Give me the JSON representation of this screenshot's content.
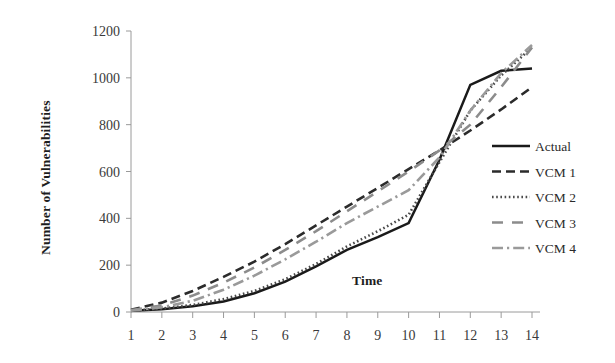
{
  "chart_data": {
    "type": "line",
    "title": "",
    "xlabel": "Time",
    "ylabel": "Number of Vulnerabilities",
    "x": [
      1,
      2,
      3,
      4,
      5,
      6,
      7,
      8,
      9,
      10,
      11,
      12,
      13,
      14
    ],
    "xticklabels": [
      "1",
      "2",
      "3",
      "4",
      "5",
      "6",
      "7",
      "8",
      "9",
      "10",
      "11",
      "12",
      "13",
      "14"
    ],
    "yticklabels": [
      "0",
      "200",
      "400",
      "600",
      "800",
      "1000",
      "1200"
    ],
    "yticks": [
      0,
      200,
      400,
      600,
      800,
      1000,
      1200
    ],
    "ylim": [
      0,
      1200
    ],
    "xlim": [
      1,
      14
    ],
    "grid": false,
    "legend_position": "right",
    "series": [
      {
        "name": "Actual",
        "style": "solid",
        "color": "#1a1a1a",
        "values": [
          5,
          12,
          25,
          45,
          80,
          130,
          195,
          265,
          320,
          380,
          650,
          970,
          1030,
          1040
        ]
      },
      {
        "name": "VCM 1",
        "style": "dashed",
        "color": "#2b2b2b",
        "values": [
          10,
          40,
          90,
          150,
          215,
          290,
          370,
          450,
          530,
          610,
          690,
          775,
          865,
          960
        ]
      },
      {
        "name": "VCM 2",
        "style": "dotted",
        "color": "#4a4a4a",
        "values": [
          5,
          15,
          30,
          55,
          90,
          140,
          205,
          280,
          345,
          415,
          640,
          860,
          1010,
          1130
        ]
      },
      {
        "name": "VCM 3",
        "style": "longdash",
        "color": "#8c8c8c",
        "values": [
          8,
          28,
          70,
          125,
          190,
          265,
          345,
          430,
          515,
          600,
          690,
          800,
          960,
          1130
        ]
      },
      {
        "name": "VCM 4",
        "style": "dashdot",
        "color": "#9a9a9a",
        "values": [
          6,
          20,
          48,
          95,
          155,
          225,
          300,
          380,
          450,
          520,
          660,
          860,
          1020,
          1140
        ]
      }
    ]
  },
  "legend": {
    "entries": [
      {
        "label": "Actual"
      },
      {
        "label": "VCM 1"
      },
      {
        "label": "VCM 2"
      },
      {
        "label": "VCM 3"
      },
      {
        "label": "VCM 4"
      }
    ]
  }
}
